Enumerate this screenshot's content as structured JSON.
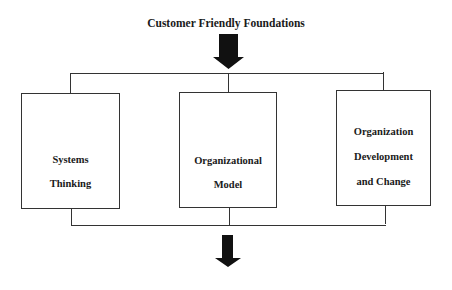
{
  "diagram": {
    "title": "Customer Friendly Foundations",
    "boxes": [
      {
        "id": "systems-thinking",
        "lines": [
          "Systems",
          "Thinking"
        ]
      },
      {
        "id": "organizational-model",
        "lines": [
          "Organizational",
          "Model"
        ]
      },
      {
        "id": "organization-development",
        "lines": [
          "Organization",
          "Development",
          "and Change"
        ]
      }
    ],
    "arrows": [
      {
        "position": "top",
        "direction": "down",
        "color": "#111111"
      },
      {
        "position": "bottom",
        "direction": "down",
        "color": "#111111"
      }
    ],
    "line_color": "#333333"
  }
}
